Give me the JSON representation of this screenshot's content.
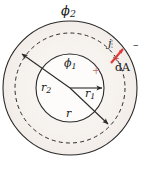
{
  "figure": {
    "background_color": "#ffffff",
    "line_color": "#2b2b2b",
    "accent_color": "#e03a3a",
    "shade_color": "#f7f4f1",
    "labels": {
      "phi2": "ϕ",
      "phi2_sub": "2",
      "phi1": "ϕ",
      "phi1_sub": "1",
      "r1": "r",
      "r1_sub": "1",
      "r2": "r",
      "r2_sub": "2",
      "r": "r",
      "j": "j",
      "dA": "dA",
      "minus_sign": "–",
      "plus_sign_inner": "+",
      "plus_sign_red": "+"
    },
    "geometry": {
      "center_x": 70,
      "center_y": 88,
      "outer_radius": 67,
      "dashed_radius": 55,
      "inner_radius": 34,
      "r1_arrow": {
        "from_x": 70,
        "from_y": 88,
        "to_x": 104,
        "to_y": 88
      },
      "r2_arrow": {
        "from_x": 70,
        "from_y": 88,
        "to_x": 20,
        "to_y": 52
      },
      "r_arrow": {
        "from_x": 70,
        "from_y": 88,
        "to_x": 110,
        "to_y": 125
      },
      "j_vector": {
        "from_x": 112,
        "from_y": 62,
        "to_x": 124,
        "to_y": 48
      }
    }
  }
}
